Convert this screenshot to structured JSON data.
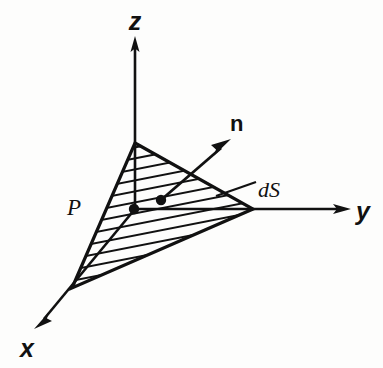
{
  "figure": {
    "kind": "3d-axes-diagram",
    "background_color": "#fdfdfc",
    "ink_color": "#111111",
    "labels": {
      "z_axis": "z",
      "y_axis": "y",
      "x_axis": "x",
      "normal_vector": "n",
      "point": "P",
      "surface_element": "dS"
    },
    "geometry": {
      "origin": {
        "x": 135,
        "y": 209
      },
      "z_axis_tip": {
        "x": 135,
        "y": 38
      },
      "y_axis_tip": {
        "x": 349,
        "y": 209
      },
      "x_axis_tip": {
        "x": 35,
        "y": 327
      },
      "triangle_vertices": [
        {
          "name": "z-intercept",
          "x": 135,
          "y": 143
        },
        {
          "name": "y-intercept",
          "x": 253,
          "y": 209
        },
        {
          "name": "x-intercept",
          "x": 72,
          "y": 288
        }
      ],
      "origin_dot": {
        "x": 134,
        "y": 209,
        "r": 5
      },
      "ds_dot": {
        "x": 161,
        "y": 200,
        "r": 5
      },
      "normal_arrow": {
        "x1": 161,
        "y1": 200,
        "x2": 229,
        "y2": 140
      },
      "ds_leader": {
        "x1": 217,
        "y1": 195,
        "x2": 256,
        "y2": 182
      },
      "hatch_angle_deg": -11,
      "hatch_spacing_px": 11
    },
    "label_positions": {
      "z": {
        "x": 135,
        "y": 30
      },
      "y": {
        "x": 356,
        "y": 219
      },
      "x": {
        "x": 20,
        "y": 356
      },
      "n": {
        "x": 230,
        "y": 131
      },
      "P": {
        "x": 68,
        "y": 214
      },
      "dS": {
        "x": 258,
        "y": 197
      }
    }
  }
}
